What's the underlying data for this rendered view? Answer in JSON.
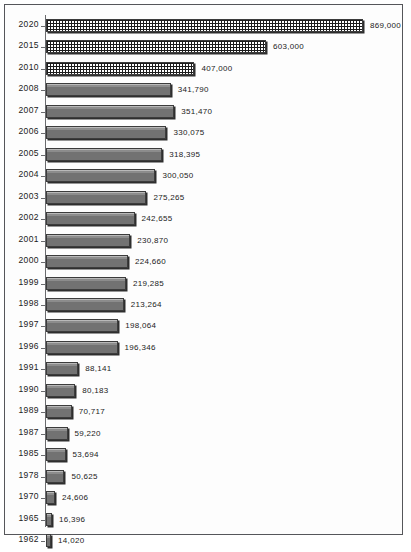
{
  "chart_data": {
    "type": "bar",
    "orientation": "horizontal",
    "title": "",
    "subtitle": "",
    "xlabel": "",
    "ylabel": "",
    "grid": false,
    "legend": null,
    "xlim": [
      0,
      869000
    ],
    "axis_origin": 0,
    "categories": [
      "2020",
      "2015",
      "2010",
      "2008",
      "2007",
      "2006",
      "2005",
      "2004",
      "2003",
      "2002",
      "2001",
      "2000",
      "1999",
      "1998",
      "1997",
      "1996",
      "1991",
      "1990",
      "1989",
      "1987",
      "1985",
      "1978",
      "1970",
      "1965",
      "1962"
    ],
    "values": [
      869000,
      603000,
      407000,
      341790,
      351470,
      330075,
      318395,
      300050,
      275265,
      242655,
      230870,
      224660,
      219285,
      213264,
      198064,
      196346,
      88141,
      80183,
      70717,
      59220,
      53694,
      50625,
      24606,
      16396,
      14020
    ],
    "value_labels": [
      "869,000",
      "603,000",
      "407,000",
      "341,790",
      "351,470",
      "330,075",
      "318,395",
      "300,050",
      "275,265",
      "242,655",
      "230,870",
      "224,660",
      "219,285",
      "213,264",
      "198,064",
      "196,346",
      "88,141",
      "80,183",
      "70,717",
      "59,220",
      "53,694",
      "50,625",
      "24,606",
      "16,396",
      "14,020"
    ],
    "bar_styles": [
      "hatch",
      "hatch",
      "hatch",
      "solid",
      "solid",
      "solid",
      "solid",
      "solid",
      "solid",
      "solid",
      "solid",
      "solid",
      "solid",
      "solid",
      "solid",
      "solid",
      "solid",
      "solid",
      "solid",
      "solid",
      "solid",
      "solid",
      "solid",
      "solid",
      "solid"
    ],
    "colors": {
      "bar_solid": "#7a7a7a",
      "bar_hatch_ink": "#1c1c1c",
      "bar_outline": "#3c3c3c",
      "axis": "#6a6b6e",
      "frame": "#55565a",
      "text": "#1b1b1b",
      "background": "#fdfdfd"
    }
  }
}
